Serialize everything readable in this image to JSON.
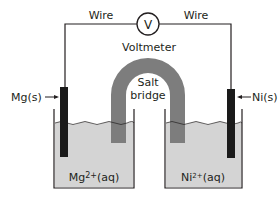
{
  "diagram": {
    "labels": {
      "wire_left": "Wire",
      "wire_right": "Wire",
      "voltmeter_symbol": "V",
      "voltmeter": "Voltmeter",
      "salt_bridge_line1": "Salt",
      "salt_bridge_line2": "bridge",
      "anode": "Mg(s)",
      "cathode": "Ni(s)",
      "left_solution": "Mg2+(aq)",
      "right_solution": "Ni2+(aq)"
    },
    "colors": {
      "wire": "#231f20",
      "electrode": "#1a1a1a",
      "salt_bridge": "#7d7d7d",
      "solution": "#d4d4d4",
      "beaker": "#231f20"
    }
  }
}
